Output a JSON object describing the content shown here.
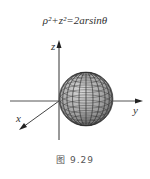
{
  "equation": "ρ²+z²=2arsinθ",
  "axes": {
    "x_label": "x",
    "y_label": "y",
    "z_label": "z"
  },
  "caption": {
    "prefix": "图",
    "number": "9.29"
  },
  "caption_text": "图   9.29"
}
